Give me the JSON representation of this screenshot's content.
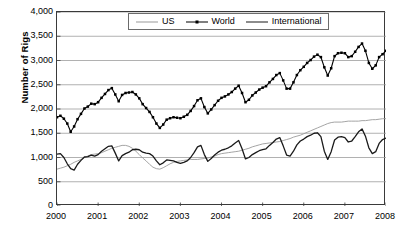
{
  "chart_data": {
    "type": "line",
    "title": "",
    "xlabel": "",
    "ylabel": "Number of Rigs",
    "xlim": [
      2000,
      2008
    ],
    "ylim": [
      0,
      4000
    ],
    "grid": true,
    "legend_position": "top-center",
    "y_ticks": [
      "0",
      "500",
      "1,000",
      "1,500",
      "2,000",
      "2,500",
      "3,000",
      "3,500",
      "4,000"
    ],
    "y_tick_values": [
      0,
      500,
      1000,
      1500,
      2000,
      2500,
      3000,
      3500,
      4000
    ],
    "x_ticks": [
      "2000",
      "2001",
      "2002",
      "2003",
      "2004",
      "2005",
      "2006",
      "2007",
      "2008"
    ],
    "x_tick_values": [
      2000,
      2001,
      2002,
      2003,
      2004,
      2005,
      2006,
      2007,
      2008
    ],
    "x": [
      2000.0,
      2000.083,
      2000.167,
      2000.25,
      2000.333,
      2000.417,
      2000.5,
      2000.583,
      2000.667,
      2000.75,
      2000.833,
      2000.917,
      2001.0,
      2001.083,
      2001.167,
      2001.25,
      2001.333,
      2001.417,
      2001.5,
      2001.583,
      2001.667,
      2001.75,
      2001.833,
      2001.917,
      2002.0,
      2002.083,
      2002.167,
      2002.25,
      2002.333,
      2002.417,
      2002.5,
      2002.583,
      2002.667,
      2002.75,
      2002.833,
      2002.917,
      2003.0,
      2003.083,
      2003.167,
      2003.25,
      2003.333,
      2003.417,
      2003.5,
      2003.583,
      2003.667,
      2003.75,
      2003.833,
      2003.917,
      2004.0,
      2004.083,
      2004.167,
      2004.25,
      2004.333,
      2004.417,
      2004.5,
      2004.583,
      2004.667,
      2004.75,
      2004.833,
      2004.917,
      2005.0,
      2005.083,
      2005.167,
      2005.25,
      2005.333,
      2005.417,
      2005.5,
      2005.583,
      2005.667,
      2005.75,
      2005.833,
      2005.917,
      2006.0,
      2006.083,
      2006.167,
      2006.25,
      2006.333,
      2006.417,
      2006.5,
      2006.583,
      2006.667,
      2006.75,
      2006.833,
      2006.917,
      2007.0,
      2007.083,
      2007.167,
      2007.25,
      2007.333,
      2007.417,
      2007.5,
      2007.583,
      2007.667,
      2007.75,
      2007.833,
      2007.917,
      2008.0
    ],
    "series": [
      {
        "name": "US",
        "color": "#9a9a9a",
        "width": 0.9,
        "marker": "none",
        "values": [
          760,
          780,
          800,
          830,
          860,
          900,
          930,
          960,
          1000,
          1030,
          1060,
          1070,
          1080,
          1100,
          1130,
          1160,
          1190,
          1210,
          1230,
          1250,
          1250,
          1230,
          1190,
          1130,
          1060,
          990,
          930,
          860,
          800,
          770,
          760,
          790,
          830,
          870,
          900,
          920,
          930,
          940,
          950,
          960,
          960,
          960,
          970,
          980,
          990,
          1010,
          1030,
          1060,
          1080,
          1090,
          1100,
          1110,
          1120,
          1130,
          1150,
          1170,
          1190,
          1220,
          1240,
          1260,
          1280,
          1290,
          1300,
          1310,
          1320,
          1330,
          1350,
          1370,
          1390,
          1420,
          1440,
          1460,
          1490,
          1520,
          1550,
          1580,
          1610,
          1640,
          1670,
          1700,
          1720,
          1730,
          1730,
          1730,
          1740,
          1750,
          1750,
          1750,
          1750,
          1760,
          1760,
          1770,
          1780,
          1780,
          1790,
          1800,
          1800
        ]
      },
      {
        "name": "World",
        "color": "#000000",
        "width": 1.1,
        "marker": "square",
        "values": [
          1830,
          1860,
          1800,
          1700,
          1530,
          1640,
          1790,
          1900,
          2010,
          2050,
          2110,
          2100,
          2140,
          2230,
          2310,
          2390,
          2430,
          2300,
          2160,
          2290,
          2330,
          2340,
          2350,
          2300,
          2220,
          2100,
          2020,
          1940,
          1830,
          1700,
          1610,
          1680,
          1780,
          1810,
          1830,
          1820,
          1810,
          1840,
          1880,
          1960,
          2060,
          2180,
          2220,
          2040,
          1910,
          1990,
          2080,
          2170,
          2230,
          2260,
          2300,
          2350,
          2420,
          2480,
          2330,
          2140,
          2190,
          2280,
          2340,
          2400,
          2440,
          2470,
          2550,
          2620,
          2700,
          2740,
          2590,
          2420,
          2420,
          2550,
          2700,
          2800,
          2870,
          2950,
          3010,
          3080,
          3120,
          3070,
          2860,
          2690,
          2840,
          3090,
          3150,
          3160,
          3150,
          3070,
          3090,
          3180,
          3280,
          3350,
          3200,
          2950,
          2830,
          2900,
          3070,
          3130,
          3200
        ]
      },
      {
        "name": "International",
        "color": "#1a1a1a",
        "width": 1.3,
        "marker": "none",
        "values": [
          1070,
          1080,
          1000,
          870,
          770,
          740,
          860,
          940,
          1010,
          1020,
          1050,
          1030,
          1060,
          1130,
          1180,
          1230,
          1240,
          1090,
          930,
          1040,
          1080,
          1110,
          1160,
          1170,
          1160,
          1110,
          1090,
          1080,
          1030,
          930,
          850,
          890,
          950,
          940,
          930,
          900,
          880,
          900,
          930,
          1000,
          1100,
          1220,
          1250,
          1060,
          920,
          980,
          1050,
          1110,
          1150,
          1170,
          1200,
          1240,
          1300,
          1350,
          1180,
          970,
          1000,
          1060,
          1100,
          1140,
          1160,
          1180,
          1250,
          1310,
          1380,
          1410,
          1240,
          1050,
          1030,
          1130,
          1260,
          1340,
          1380,
          1430,
          1460,
          1500,
          1510,
          1430,
          1130,
          960,
          1120,
          1360,
          1420,
          1430,
          1410,
          1320,
          1340,
          1430,
          1530,
          1590,
          1440,
          1200,
          1080,
          1120,
          1290,
          1370,
          1400
        ]
      }
    ]
  },
  "legend": {
    "items": [
      {
        "label": "US",
        "swatch": "thin-gray-line"
      },
      {
        "label": "World",
        "swatch": "black-line-square-marker"
      },
      {
        "label": "International",
        "swatch": "thick-black-line"
      }
    ]
  }
}
